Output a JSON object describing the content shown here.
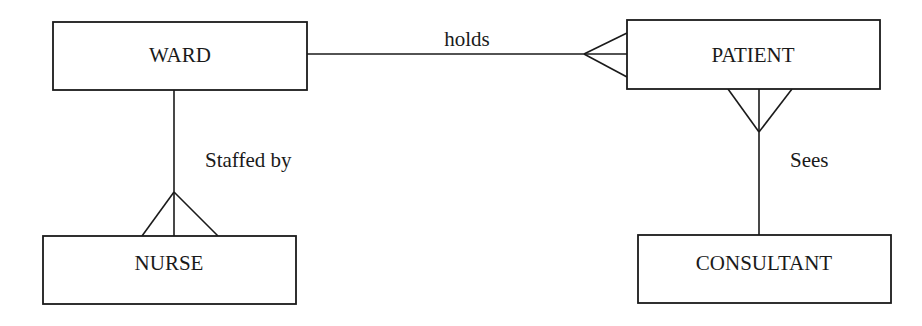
{
  "diagram": {
    "type": "entity-relationship",
    "notation": "crows-foot",
    "entities": [
      {
        "id": "ward",
        "label": "WARD",
        "x": 53,
        "y": 22,
        "w": 254,
        "h": 68
      },
      {
        "id": "patient",
        "label": "PATIENT",
        "x": 627,
        "y": 20,
        "w": 253,
        "h": 69
      },
      {
        "id": "nurse",
        "label": "NURSE",
        "x": 43,
        "y": 236,
        "w": 253,
        "h": 68
      },
      {
        "id": "consultant",
        "label": "CONSULTANT",
        "x": 638,
        "y": 235,
        "w": 253,
        "h": 68
      }
    ],
    "relationships": [
      {
        "id": "holds",
        "label": "holds",
        "from": "WARD",
        "to": "PATIENT",
        "cardinality": "one-to-many",
        "many_end": "PATIENT",
        "label_pos": {
          "x": 467,
          "y": 46
        }
      },
      {
        "id": "staffed-by",
        "label": "Staffed by",
        "from": "WARD",
        "to": "NURSE",
        "cardinality": "one-to-many",
        "many_end": "NURSE",
        "label_pos": {
          "x": 205,
          "y": 167
        }
      },
      {
        "id": "sees",
        "label": "Sees",
        "from": "CONSULTANT",
        "to": "PATIENT",
        "cardinality": "one-to-many",
        "many_end": "PATIENT",
        "label_pos": {
          "x": 790,
          "y": 167
        }
      }
    ]
  }
}
